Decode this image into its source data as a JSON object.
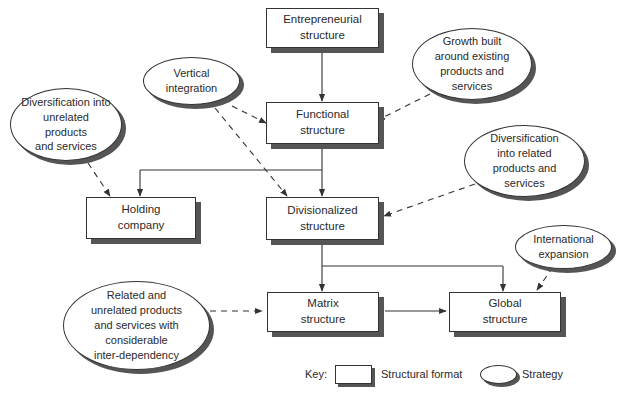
{
  "structures": {
    "entrepreneurial": "Entrepreneurial\nstructure",
    "functional": "Functional\nstructure",
    "holding": "Holding\ncompany",
    "divisionalized": "Divisionalized\nstructure",
    "matrix": "Matrix\nstructure",
    "global": "Global\nstructure"
  },
  "strategies": {
    "vertical_integration": "Vertical\nintegration",
    "growth_existing": "Growth built\naround existing\nproducts and\nservices",
    "diversification_unrelated": "Diversification into\nunrelated products\nand services",
    "diversification_related": "Diversification\ninto related\nproducts and\nservices",
    "international": "International\nexpansion",
    "related_unrelated": "Related and\nunrelated products\nand services with\nconsiderable\ninter-dependency"
  },
  "key": {
    "label": "Key:",
    "structural_format": "Structural format",
    "strategy": "Strategy"
  },
  "colors": {
    "line": "#333333",
    "shadow": "#555555"
  }
}
